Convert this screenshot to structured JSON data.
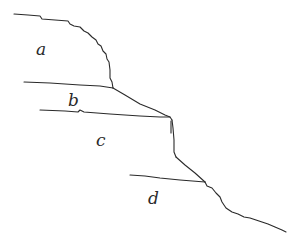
{
  "diagram": {
    "type": "hand-drawn stepped slope profile",
    "labels": [
      {
        "id": "a",
        "text": "a",
        "x": 36,
        "y": 55
      },
      {
        "id": "b",
        "text": "b",
        "x": 68,
        "y": 106
      },
      {
        "id": "c",
        "text": "c",
        "x": 96,
        "y": 146
      },
      {
        "id": "d",
        "text": "d",
        "x": 148,
        "y": 204
      }
    ],
    "stroke_color": "#2a2a2a",
    "background_color": "#ffffff"
  }
}
